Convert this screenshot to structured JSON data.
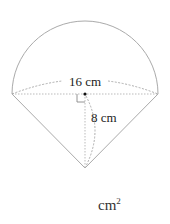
{
  "figure": {
    "diameter_label": "16 cm",
    "height_label": "8 cm",
    "unit_text": "cm",
    "unit_exponent": "2",
    "colors": {
      "stroke": "#aaaaaa",
      "dash": "#999999",
      "text": "#222222"
    }
  }
}
